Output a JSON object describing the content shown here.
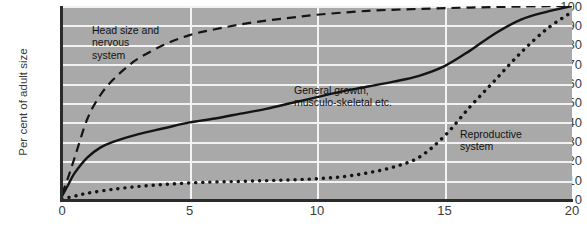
{
  "chart_data": {
    "type": "line",
    "title": "",
    "xlabel": "",
    "ylabel": "Per cent of adult size",
    "xlim": [
      0,
      20
    ],
    "ylim": [
      0,
      100
    ],
    "xticks": [
      0,
      5,
      10,
      15,
      20
    ],
    "yticks": [
      0,
      10,
      20,
      30,
      40,
      50,
      60,
      70,
      80,
      90,
      100
    ],
    "grid": true,
    "legend_position": "inline-annotations",
    "plot_background": "#a9a9a9",
    "gridline_color": "#f2f2f2",
    "line_color": "#111111",
    "series": [
      {
        "name": "Head size and nervous system",
        "style": "dashed",
        "x": [
          0,
          0.25,
          0.5,
          1,
          1.5,
          2,
          2.5,
          3,
          4,
          5,
          6,
          7,
          8,
          9,
          10,
          12,
          14,
          16,
          18,
          20
        ],
        "values": [
          3,
          12,
          22,
          42,
          54,
          62,
          68,
          73,
          80,
          85,
          88,
          90.5,
          92.5,
          94,
          95.5,
          97.5,
          98.5,
          99.2,
          99.7,
          100
        ]
      },
      {
        "name": "General growth, musculo-skeletal etc.",
        "style": "solid",
        "x": [
          0,
          0.25,
          0.5,
          1,
          1.5,
          2,
          3,
          4,
          5,
          6,
          7,
          8,
          9,
          10,
          11,
          12,
          13,
          14,
          15,
          16,
          17,
          18,
          19,
          20
        ],
        "values": [
          2,
          8,
          14,
          22,
          27,
          30,
          34,
          37,
          40,
          42,
          44.5,
          47,
          50,
          53,
          56,
          58.5,
          61,
          64,
          69,
          77,
          86,
          93,
          97,
          100
        ]
      },
      {
        "name": "Reproductive system",
        "style": "dotted",
        "x": [
          0,
          0.5,
          1,
          2,
          3,
          4,
          5,
          6,
          7,
          8,
          9,
          10,
          11,
          12,
          13,
          14,
          15,
          16,
          17,
          18,
          19,
          20
        ],
        "values": [
          0.5,
          2,
          3.5,
          5.5,
          7,
          8,
          8.8,
          9.3,
          9.6,
          10,
          10.4,
          11,
          12,
          14,
          17,
          22,
          33,
          48,
          62,
          76,
          88,
          97
        ]
      }
    ],
    "annotations": [
      {
        "id": "neural-label",
        "text": "Head size and\nnervous\nsystem",
        "x_px": 92,
        "y_px": 24
      },
      {
        "id": "general-label",
        "text": "General growth,\nmusculo-skeletal etc.",
        "x_px": 294,
        "y_px": 84
      },
      {
        "id": "reproductive-label",
        "text": "Reproductive\nsystem",
        "x_px": 460,
        "y_px": 128
      }
    ]
  },
  "axis": {
    "y_label": "Per cent of adult size",
    "y_tick_labels": [
      "100",
      "90",
      "80",
      "70",
      "60",
      "50",
      "40",
      "30",
      "20",
      "10",
      "0"
    ],
    "x_tick_labels": [
      "0",
      "5",
      "10",
      "15",
      "20"
    ]
  }
}
